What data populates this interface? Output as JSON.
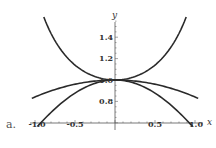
{
  "chart_data": {
    "type": "line",
    "panel_label": "a.",
    "title": "",
    "xlabel": "x",
    "ylabel": "y",
    "xlim": [
      -1.0,
      1.0
    ],
    "ylim": [
      0.6,
      1.55
    ],
    "x_ticks": [
      "-1.0",
      "-0.5",
      "0.5",
      "1.0"
    ],
    "y_ticks": [
      "0.8",
      "1.0",
      "1.2",
      "1.4"
    ],
    "grid": false,
    "legend": null,
    "series": [
      {
        "name": "upper curve (≈ sec x)",
        "x": [
          -0.89,
          -0.75,
          -0.5,
          -0.25,
          0,
          0.25,
          0.5,
          0.75,
          0.89
        ],
        "y": [
          1.59,
          1.37,
          1.14,
          1.03,
          1.0,
          1.03,
          1.14,
          1.37,
          1.59
        ]
      },
      {
        "name": "middle curve (≈ 1 - x²/6)",
        "x": [
          -1.04,
          -0.75,
          -0.5,
          -0.25,
          0,
          0.25,
          0.5,
          0.75,
          1.04
        ],
        "y": [
          0.84,
          0.91,
          0.96,
          0.99,
          1.0,
          0.99,
          0.96,
          0.91,
          0.84
        ]
      },
      {
        "name": "lower curve (≈ cos x)",
        "x": [
          -0.97,
          -0.75,
          -0.5,
          -0.25,
          0,
          0.25,
          0.5,
          0.75,
          0.97
        ],
        "y": [
          0.57,
          0.73,
          0.88,
          0.97,
          1.0,
          0.97,
          0.88,
          0.73,
          0.57
        ]
      }
    ]
  }
}
